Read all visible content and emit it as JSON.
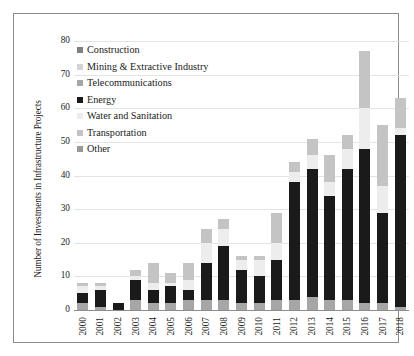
{
  "chart_data": {
    "type": "bar",
    "subtype": "stacked-bar",
    "title": "",
    "xlabel": "",
    "ylabel": "Number of Investments in Infrastructure Projects",
    "ylim": [
      0,
      80
    ],
    "yticks": [
      0,
      10,
      20,
      30,
      40,
      50,
      60,
      70,
      80
    ],
    "grid": true,
    "legend_position": "top-left",
    "categories": [
      "2000",
      "2001",
      "2002",
      "2003",
      "2004",
      "2005",
      "2006",
      "2007",
      "2008",
      "2009",
      "2010",
      "2011",
      "2012",
      "2013",
      "2014",
      "2015",
      "2016",
      "2017",
      "2018"
    ],
    "series": [
      {
        "name": "Construction",
        "color": "#808080",
        "values": [
          0,
          0,
          0,
          0,
          0,
          0,
          0,
          0,
          0,
          0,
          0,
          0,
          0,
          0,
          0,
          0,
          0,
          0,
          0
        ]
      },
      {
        "name": "Mining & Extractive Industry",
        "color": "#d4d4d4",
        "values": [
          0,
          0,
          0,
          0,
          0,
          0,
          0,
          0,
          0,
          0,
          0,
          0,
          0,
          0,
          0,
          0,
          0,
          0,
          0
        ]
      },
      {
        "name": "Telecommunications",
        "color": "#a6a6a6",
        "values": [
          2,
          1,
          0,
          3,
          2,
          2,
          3,
          3,
          3,
          2,
          2,
          3,
          3,
          4,
          3,
          3,
          2,
          2,
          1
        ]
      },
      {
        "name": "Energy",
        "color": "#1a1a1a",
        "values": [
          3,
          5,
          2,
          6,
          4,
          5,
          3,
          11,
          16,
          10,
          8,
          12,
          35,
          38,
          31,
          39,
          46,
          27,
          51
        ]
      },
      {
        "name": "Water and Sanitation",
        "color": "#ededed",
        "values": [
          2,
          1,
          0,
          1,
          2,
          1,
          3,
          6,
          5,
          3,
          5,
          5,
          3,
          4,
          4,
          6,
          12,
          8,
          2
        ]
      },
      {
        "name": "Transportation",
        "color": "#c4c4c4",
        "values": [
          1,
          1,
          0,
          2,
          6,
          3,
          5,
          4,
          3,
          1,
          1,
          9,
          3,
          5,
          8,
          4,
          17,
          18,
          9
        ]
      },
      {
        "name": "Other",
        "color": "#999999",
        "values": [
          0,
          0,
          0,
          0,
          0,
          0,
          0,
          0,
          0,
          0,
          0,
          0,
          0,
          0,
          0,
          0,
          0,
          0,
          0
        ]
      }
    ],
    "totals": [
      8,
      8,
      2,
      12,
      14,
      11,
      14,
      24,
      27,
      16,
      16,
      29,
      44,
      51,
      46,
      52,
      77,
      55,
      63
    ]
  },
  "legend": {
    "items": [
      {
        "label": "Construction",
        "color": "#808080"
      },
      {
        "label": "Mining & Extractive Industry",
        "color": "#d4d4d4"
      },
      {
        "label": "Telecommunications",
        "color": "#a6a6a6"
      },
      {
        "label": "Energy",
        "color": "#1a1a1a"
      },
      {
        "label": "Water and Sanitation",
        "color": "#ededed"
      },
      {
        "label": "Transportation",
        "color": "#c4c4c4"
      },
      {
        "label": "Other",
        "color": "#999999"
      }
    ]
  },
  "axis": {
    "y_title": "Number of Investments in Infrastructure Projects"
  }
}
